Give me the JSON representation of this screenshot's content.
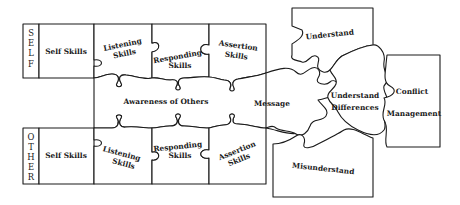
{
  "diagram": {
    "type": "puzzle-diagram",
    "rows": {
      "self": {
        "side_label": [
          "S",
          "E",
          "L",
          "F"
        ],
        "pieces": [
          "Self Skills",
          "Listening",
          "Skills",
          "Responding",
          "Skills",
          "Assertion",
          "Skills"
        ]
      },
      "other": {
        "side_label": [
          "O",
          "T",
          "H",
          "E",
          "R"
        ],
        "pieces": [
          "Self Skills",
          "Listening",
          "Skills",
          "Responding",
          "Skills",
          "Assertion",
          "Skills"
        ]
      }
    },
    "center": {
      "awareness": "Awareness of Others",
      "message": "Message"
    },
    "outcomes": {
      "understand": "Understand",
      "misunderstand": "Misunderstand",
      "understand_differences_line1": "Understand",
      "understand_differences_line2": "Differences",
      "conflict_line1": "Conflict",
      "conflict_line2": "Management"
    },
    "colors": {
      "stroke": "#1a1a1a",
      "fill": "#ffffff"
    }
  }
}
